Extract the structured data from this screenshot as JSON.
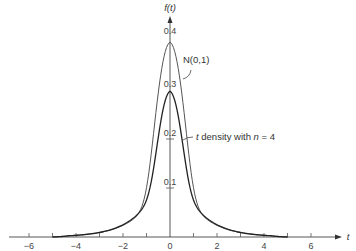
{
  "chart_data": {
    "type": "line",
    "title": "",
    "xlabel": "t",
    "ylabel": "f(t)",
    "xlim": [
      -7,
      7
    ],
    "ylim": [
      0,
      0.45
    ],
    "x_ticks": [
      -6,
      -5,
      -4,
      -3,
      -2,
      -1,
      0,
      1,
      2,
      3,
      4,
      5,
      6
    ],
    "x_tick_labels": [
      "−6",
      "−4",
      "−2",
      "0",
      "2",
      "4",
      "6"
    ],
    "x_tick_label_values": [
      -6,
      -4,
      -2,
      0,
      2,
      4,
      6
    ],
    "y_tick_labels": [
      "0.1",
      "0.2",
      "0.3",
      "0.4"
    ],
    "y_tick_values": [
      0.1,
      0.2,
      0.3,
      0.4
    ],
    "grid": false,
    "legend": "none (inline annotations)",
    "series": [
      {
        "name": "N(0,1)",
        "x": [
          -5,
          -4,
          -3,
          -2,
          -1.5,
          -1,
          -0.5,
          0,
          0.5,
          1,
          1.5,
          2,
          3,
          4,
          5
        ],
        "values": [
          0.0,
          0.004,
          0.02,
          0.06,
          0.1,
          0.2,
          0.35,
          0.4,
          0.35,
          0.2,
          0.1,
          0.06,
          0.02,
          0.004,
          0.0
        ]
      },
      {
        "name": "t density with n = 4",
        "x": [
          -5,
          -4,
          -3,
          -2,
          -1.5,
          -1,
          -0.5,
          0,
          0.5,
          1,
          1.5,
          2,
          3,
          4,
          5
        ],
        "values": [
          0.0,
          0.007,
          0.025,
          0.065,
          0.1,
          0.16,
          0.26,
          0.3,
          0.26,
          0.16,
          0.1,
          0.065,
          0.025,
          0.007,
          0.0
        ]
      }
    ],
    "annotations": [
      {
        "text": "N(0,1)",
        "points_to": "N(0,1) curve near t≈0.6"
      },
      {
        "text": "t density with n = 4",
        "points_to": "t curve near t≈0.6"
      }
    ]
  },
  "labels": {
    "y_axis": "f(t)",
    "x_axis": "t",
    "normal_ann": "N(0,1)",
    "t_ann_prefix": "t",
    "t_ann_mid": " density with ",
    "t_ann_n": "n",
    "t_ann_suffix": " = 4"
  }
}
